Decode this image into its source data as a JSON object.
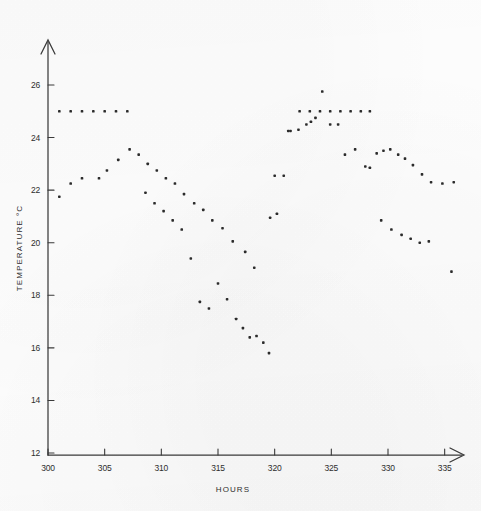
{
  "chart_data": {
    "type": "scatter",
    "title": "",
    "xlabel": "HOURS",
    "ylabel": "TEMPERATURE °C",
    "xlim": [
      298,
      338
    ],
    "ylim": [
      12,
      26.8
    ],
    "xticks": [
      300,
      305,
      310,
      315,
      320,
      325,
      330,
      335
    ],
    "xticklabels": [
      "300",
      "305",
      "310",
      "315",
      "320",
      "325",
      "330",
      "335"
    ],
    "yticks": [
      12,
      14,
      16,
      18,
      20,
      22,
      24,
      26
    ],
    "yticklabels": [
      "12",
      "14",
      "16",
      "18",
      "20",
      "22",
      "24",
      "26"
    ],
    "grid": false,
    "legend": null,
    "marker": "square-dot",
    "marker_color": "#2b2b2b",
    "marker_size": 2.6,
    "series": [
      {
        "name": "upper-plateau-left",
        "points": [
          [
            301.0,
            25.0
          ],
          [
            302.0,
            25.0
          ],
          [
            303.0,
            25.0
          ],
          [
            304.0,
            25.0
          ],
          [
            305.0,
            25.0
          ],
          [
            306.0,
            25.0
          ],
          [
            307.0,
            25.0
          ]
        ]
      },
      {
        "name": "upper-curve",
        "points": [
          [
            301.0,
            21.75
          ],
          [
            302.0,
            22.25
          ],
          [
            303.0,
            22.45
          ],
          [
            304.5,
            22.45
          ],
          [
            305.2,
            22.75
          ],
          [
            306.2,
            23.15
          ],
          [
            307.2,
            23.55
          ],
          [
            308.0,
            23.35
          ],
          [
            308.8,
            23.0
          ],
          [
            309.6,
            22.75
          ],
          [
            310.4,
            22.45
          ],
          [
            311.2,
            22.25
          ],
          [
            312.0,
            21.85
          ],
          [
            312.9,
            21.5
          ],
          [
            313.7,
            21.25
          ],
          [
            314.5,
            20.85
          ],
          [
            315.4,
            20.55
          ],
          [
            316.3,
            20.05
          ],
          [
            317.4,
            19.65
          ],
          [
            318.2,
            19.05
          ],
          [
            319.6,
            20.95
          ],
          [
            320.2,
            21.1
          ],
          [
            320.8,
            22.55
          ],
          [
            321.4,
            24.25
          ],
          [
            322.1,
            24.3
          ],
          [
            322.8,
            24.5
          ],
          [
            323.2,
            24.6
          ],
          [
            323.6,
            24.75
          ],
          [
            324.2,
            25.75
          ],
          [
            324.9,
            24.5
          ]
        ]
      },
      {
        "name": "lower-curve",
        "points": [
          [
            308.6,
            21.9
          ],
          [
            309.4,
            21.5
          ],
          [
            310.2,
            21.2
          ],
          [
            311.0,
            20.85
          ],
          [
            311.8,
            20.5
          ],
          [
            312.6,
            19.4
          ],
          [
            313.4,
            17.75
          ],
          [
            314.2,
            17.5
          ],
          [
            315.0,
            18.45
          ],
          [
            315.8,
            17.85
          ],
          [
            316.6,
            17.1
          ],
          [
            317.2,
            16.75
          ],
          [
            317.8,
            16.4
          ],
          [
            318.4,
            16.45
          ],
          [
            319.0,
            16.2
          ],
          [
            319.5,
            15.8
          ]
        ]
      },
      {
        "name": "upper-plateau-right",
        "points": [
          [
            322.2,
            25.0
          ],
          [
            323.1,
            25.0
          ],
          [
            324.0,
            25.0
          ],
          [
            324.9,
            25.0
          ],
          [
            325.8,
            25.0
          ],
          [
            326.7,
            25.0
          ],
          [
            327.6,
            25.0
          ],
          [
            328.4,
            25.0
          ]
        ]
      },
      {
        "name": "decline-right",
        "points": [
          [
            326.2,
            23.35
          ],
          [
            327.1,
            23.55
          ],
          [
            328.0,
            22.9
          ],
          [
            328.4,
            22.85
          ],
          [
            329.0,
            23.4
          ],
          [
            329.6,
            23.5
          ],
          [
            330.2,
            23.55
          ],
          [
            330.9,
            23.35
          ],
          [
            331.5,
            23.2
          ],
          [
            332.2,
            22.95
          ],
          [
            333.0,
            22.6
          ],
          [
            333.8,
            22.3
          ],
          [
            334.8,
            22.25
          ],
          [
            335.8,
            22.3
          ]
        ]
      },
      {
        "name": "tail-lower",
        "points": [
          [
            329.4,
            20.85
          ],
          [
            330.3,
            20.5
          ],
          [
            331.2,
            20.3
          ],
          [
            332.0,
            20.15
          ],
          [
            332.8,
            20.0
          ],
          [
            333.6,
            20.05
          ],
          [
            335.6,
            18.9
          ]
        ]
      },
      {
        "name": "stragglers",
        "points": [
          [
            320.0,
            22.55
          ],
          [
            321.2,
            24.25
          ],
          [
            325.6,
            24.5
          ]
        ]
      }
    ]
  }
}
